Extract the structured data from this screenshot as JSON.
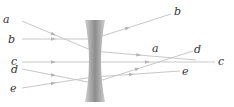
{
  "diagram": {
    "ray_color": "#c8c8c8",
    "arrow_color": "#b4b4b4",
    "label_color": "#333333",
    "lens": {
      "type": "double-concave",
      "fill_dark": "#8c8c8c",
      "fill_light": "#cfcfcf",
      "x_left": 85,
      "x_right": 105,
      "y_top": 20,
      "y_bottom": 102
    },
    "rays": [
      {
        "id": "a",
        "incoming_label": "a",
        "outgoing_label": "a",
        "points": [
          [
            22,
            21
          ],
          [
            93,
            51
          ],
          [
            196,
            60
          ]
        ],
        "in_label_pos": [
          3,
          14
        ],
        "out_label_pos": [
          152,
          43
        ]
      },
      {
        "id": "b",
        "incoming_label": "b",
        "outgoing_label": "b",
        "points": [
          [
            22,
            39
          ],
          [
            93,
            39
          ],
          [
            171,
            14
          ]
        ],
        "in_label_pos": [
          8,
          34
        ],
        "out_label_pos": [
          174,
          6
        ]
      },
      {
        "id": "c",
        "incoming_label": "c",
        "outgoing_label": "c",
        "points": [
          [
            22,
            62
          ],
          [
            93,
            62
          ],
          [
            215,
            62
          ]
        ],
        "in_label_pos": [
          11,
          56
        ],
        "out_label_pos": [
          218,
          56
        ]
      },
      {
        "id": "d",
        "incoming_label": "d",
        "outgoing_label": "d",
        "points": [
          [
            22,
            69
          ],
          [
            93,
            83
          ],
          [
            193,
            51
          ]
        ],
        "in_label_pos": [
          11,
          64
        ],
        "out_label_pos": [
          194,
          44
        ]
      },
      {
        "id": "e",
        "incoming_label": "e",
        "outgoing_label": "e",
        "points": [
          [
            22,
            88
          ],
          [
            93,
            77
          ],
          [
            180,
            71
          ]
        ],
        "in_label_pos": [
          10,
          83
        ],
        "out_label_pos": [
          182,
          66
        ]
      }
    ]
  }
}
